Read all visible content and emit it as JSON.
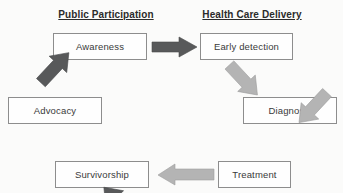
{
  "diagram": {
    "background_color": "#fbfbfa",
    "headings": [
      {
        "id": "public-participation",
        "label": "Public Participation"
      },
      {
        "id": "health-care-delivery",
        "label": "Health Care Delivery"
      }
    ],
    "node_style": {
      "fill": "#fefefe",
      "border_color": "#8d8d8d",
      "text_color": "#3a3a3a"
    },
    "arrow_colors": {
      "dark": "#58595a",
      "light": "#b4b4b4"
    },
    "nodes": [
      {
        "id": "awareness",
        "label": "Awareness",
        "group": "public-participation"
      },
      {
        "id": "early-detection",
        "label": "Early detection",
        "group": "health-care-delivery"
      },
      {
        "id": "diagnosis",
        "label": "Diagnosis",
        "group": "health-care-delivery"
      },
      {
        "id": "treatment",
        "label": "Treatment",
        "group": "health-care-delivery"
      },
      {
        "id": "survivorship",
        "label": "Survivorship",
        "group": "public-participation"
      },
      {
        "id": "advocacy",
        "label": "Advocacy",
        "group": "public-participation"
      }
    ],
    "edges": [
      {
        "id": "awareness-to-early-detection",
        "from": "Awareness",
        "to": "Early detection",
        "direction": "right",
        "color": "dark"
      },
      {
        "id": "early-detection-to-diagnosis",
        "from": "Early detection",
        "to": "Diagnosis",
        "direction": "down-right",
        "color": "light"
      },
      {
        "id": "diagnosis-to-treatment",
        "from": "Diagnosis",
        "to": "Treatment",
        "direction": "down-left",
        "color": "light"
      },
      {
        "id": "treatment-to-survivorship",
        "from": "Treatment",
        "to": "Survivorship",
        "direction": "left",
        "color": "light"
      },
      {
        "id": "survivorship-to-advocacy",
        "from": "Survivorship",
        "to": "Advocacy",
        "direction": "up-left",
        "color": "dark"
      },
      {
        "id": "advocacy-to-awareness",
        "from": "Advocacy",
        "to": "Awareness",
        "direction": "up-right",
        "color": "dark"
      }
    ]
  }
}
